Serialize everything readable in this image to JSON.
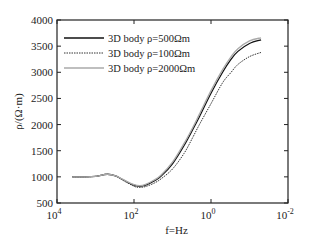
{
  "chart_data": {
    "type": "line",
    "title": "",
    "xlabel": "f=Hz",
    "ylabel": "ρ/(Ω·m)",
    "xscale": "log",
    "x_reversed": true,
    "xlim": [
      10000,
      0.01
    ],
    "ylim": [
      500,
      4000
    ],
    "x_ticks": [
      {
        "label_base": "10",
        "label_exp": "4"
      },
      {
        "label_base": "10",
        "label_exp": "2"
      },
      {
        "label_base": "10",
        "label_exp": "0"
      },
      {
        "label_base": "10",
        "label_exp": "-2"
      }
    ],
    "y_ticks": [
      "500",
      "1000",
      "1500",
      "2000",
      "2500",
      "3000",
      "3500",
      "4000"
    ],
    "grid": false,
    "legend_position": "upper left",
    "x": [
      4000,
      2000,
      1000,
      500,
      300,
      200,
      100,
      70,
      50,
      30,
      20,
      10,
      5,
      3,
      2,
      1,
      0.5,
      0.3,
      0.2,
      0.1,
      0.05
    ],
    "series": [
      {
        "name": "3D body ρ=500Ωm",
        "style": "solid",
        "color": "#111111",
        "values": [
          1000,
          1000,
          1010,
          1050,
          1020,
          950,
          840,
          820,
          840,
          920,
          1010,
          1250,
          1600,
          1900,
          2150,
          2600,
          3000,
          3250,
          3400,
          3550,
          3620
        ]
      },
      {
        "name": "3D body ρ=100Ωm",
        "style": "dotted",
        "color": "#333333",
        "values": [
          1000,
          1000,
          1010,
          1050,
          1015,
          940,
          820,
          800,
          815,
          880,
          960,
          1150,
          1450,
          1750,
          2000,
          2400,
          2800,
          3000,
          3150,
          3300,
          3380
        ]
      },
      {
        "name": "3D body ρ=2000Ωm",
        "style": "solid",
        "color": "#aaaaaa",
        "values": [
          1000,
          1000,
          1010,
          1050,
          1020,
          955,
          850,
          830,
          855,
          940,
          1030,
          1280,
          1640,
          1940,
          2200,
          2650,
          3050,
          3300,
          3450,
          3600,
          3660
        ]
      }
    ]
  }
}
